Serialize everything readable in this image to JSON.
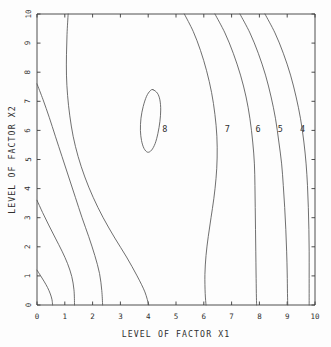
{
  "chart_data": {
    "type": "line",
    "title": "",
    "subtitle": "",
    "xlabel": "LEVEL OF FACTOR X1",
    "ylabel": "LEVEL OF FACTOR X2",
    "xlim": [
      0,
      10
    ],
    "ylim": [
      0,
      10
    ],
    "xticks": [
      "0",
      "1",
      "2",
      "3",
      "4",
      "5",
      "6",
      "7",
      "8",
      "9",
      "10"
    ],
    "yticks": [
      "0",
      "1",
      "2",
      "3",
      "4",
      "5",
      "6",
      "7",
      "8",
      "9",
      "10"
    ],
    "grid": false,
    "legend": "none",
    "plot_kind": "contour",
    "contour_levels": [
      8,
      7,
      6,
      5,
      4
    ],
    "annotations": [
      {
        "label": "8",
        "x": 4.6,
        "y": 6.05
      },
      {
        "label": "7",
        "x": 6.85,
        "y": 6.05
      },
      {
        "label": "6",
        "x": 7.95,
        "y": 6.05
      },
      {
        "label": "5",
        "x": 8.75,
        "y": 6.05
      },
      {
        "label": "4",
        "x": 9.55,
        "y": 6.05
      }
    ],
    "series": [
      {
        "name": "contour-8",
        "level": 8,
        "closed": true,
        "points": [
          [
            4.17,
            7.4
          ],
          [
            4.33,
            7.28
          ],
          [
            4.42,
            7.05
          ],
          [
            4.45,
            6.7
          ],
          [
            4.42,
            6.3
          ],
          [
            4.35,
            5.9
          ],
          [
            4.25,
            5.55
          ],
          [
            4.12,
            5.32
          ],
          [
            3.98,
            5.25
          ],
          [
            3.85,
            5.38
          ],
          [
            3.76,
            5.65
          ],
          [
            3.72,
            6.0
          ],
          [
            3.74,
            6.42
          ],
          [
            3.82,
            6.82
          ],
          [
            3.94,
            7.17
          ],
          [
            4.07,
            7.36
          ],
          [
            4.17,
            7.4
          ]
        ]
      },
      {
        "name": "contour-7",
        "level": 7,
        "closed": false,
        "points": [
          [
            5.3,
            10.0
          ],
          [
            5.62,
            9.4
          ],
          [
            5.88,
            8.75
          ],
          [
            6.1,
            8.05
          ],
          [
            6.28,
            7.3
          ],
          [
            6.4,
            6.55
          ],
          [
            6.47,
            5.8
          ],
          [
            6.48,
            5.05
          ],
          [
            6.44,
            4.35
          ],
          [
            6.36,
            3.65
          ],
          [
            6.26,
            3.0
          ],
          [
            6.16,
            2.35
          ],
          [
            6.08,
            1.7
          ],
          [
            6.04,
            1.05
          ],
          [
            6.05,
            0.4
          ],
          [
            6.08,
            0.0
          ]
        ]
      },
      {
        "name": "contour-6",
        "level": 6,
        "closed": false,
        "points": [
          [
            6.4,
            10.0
          ],
          [
            6.76,
            9.35
          ],
          [
            7.06,
            8.65
          ],
          [
            7.32,
            7.9
          ],
          [
            7.52,
            7.15
          ],
          [
            7.66,
            6.4
          ],
          [
            7.76,
            5.6
          ],
          [
            7.82,
            4.85
          ],
          [
            7.84,
            4.1
          ],
          [
            7.85,
            3.35
          ],
          [
            7.86,
            2.6
          ],
          [
            7.87,
            1.85
          ],
          [
            7.88,
            1.1
          ],
          [
            7.89,
            0.4
          ],
          [
            7.9,
            0.0
          ]
        ]
      },
      {
        "name": "contour-5",
        "level": 5,
        "closed": false,
        "points": [
          [
            7.3,
            10.0
          ],
          [
            7.66,
            9.35
          ],
          [
            7.96,
            8.65
          ],
          [
            8.22,
            7.9
          ],
          [
            8.42,
            7.15
          ],
          [
            8.58,
            6.4
          ],
          [
            8.7,
            5.6
          ],
          [
            8.8,
            4.85
          ],
          [
            8.86,
            4.1
          ],
          [
            8.91,
            3.35
          ],
          [
            8.95,
            2.6
          ],
          [
            8.98,
            1.85
          ],
          [
            9.0,
            1.1
          ],
          [
            9.01,
            0.4
          ],
          [
            9.02,
            0.0
          ]
        ]
      },
      {
        "name": "contour-4",
        "level": 4,
        "closed": false,
        "points": [
          [
            8.2,
            10.0
          ],
          [
            8.56,
            9.35
          ],
          [
            8.86,
            8.65
          ],
          [
            9.12,
            7.9
          ],
          [
            9.32,
            7.15
          ],
          [
            9.48,
            6.4
          ],
          [
            9.6,
            5.6
          ],
          [
            9.68,
            4.85
          ],
          [
            9.73,
            4.1
          ],
          [
            9.76,
            3.35
          ],
          [
            9.78,
            2.6
          ],
          [
            9.79,
            1.85
          ],
          [
            9.79,
            1.1
          ],
          [
            9.79,
            0.4
          ],
          [
            9.79,
            0.0
          ]
        ]
      },
      {
        "name": "contour-left-a",
        "level": 8,
        "closed": false,
        "points": [
          [
            1.12,
            10.0
          ],
          [
            1.08,
            9.3
          ],
          [
            1.06,
            8.6
          ],
          [
            1.06,
            7.9
          ],
          [
            1.1,
            7.2
          ],
          [
            1.18,
            6.5
          ],
          [
            1.3,
            5.8
          ],
          [
            1.48,
            5.1
          ],
          [
            1.72,
            4.4
          ],
          [
            2.02,
            3.7
          ],
          [
            2.38,
            3.0
          ],
          [
            2.8,
            2.3
          ],
          [
            3.22,
            1.65
          ],
          [
            3.6,
            1.0
          ],
          [
            3.88,
            0.45
          ],
          [
            4.02,
            0.0
          ]
        ]
      },
      {
        "name": "contour-left-b",
        "level": 7,
        "closed": false,
        "points": [
          [
            0.0,
            7.6
          ],
          [
            0.22,
            7.05
          ],
          [
            0.44,
            6.45
          ],
          [
            0.66,
            5.8
          ],
          [
            0.9,
            5.1
          ],
          [
            1.14,
            4.4
          ],
          [
            1.38,
            3.7
          ],
          [
            1.62,
            3.0
          ],
          [
            1.86,
            2.35
          ],
          [
            2.08,
            1.7
          ],
          [
            2.25,
            1.08
          ],
          [
            2.33,
            0.5
          ],
          [
            2.36,
            0.0
          ]
        ]
      },
      {
        "name": "contour-left-c",
        "level": 6,
        "closed": false,
        "points": [
          [
            0.0,
            3.6
          ],
          [
            0.2,
            3.18
          ],
          [
            0.42,
            2.75
          ],
          [
            0.66,
            2.3
          ],
          [
            0.9,
            1.85
          ],
          [
            1.1,
            1.42
          ],
          [
            1.25,
            0.98
          ],
          [
            1.33,
            0.52
          ],
          [
            1.35,
            0.0
          ]
        ]
      },
      {
        "name": "contour-left-d",
        "level": 5,
        "closed": false,
        "points": [
          [
            0.0,
            1.2
          ],
          [
            0.12,
            1.02
          ],
          [
            0.25,
            0.82
          ],
          [
            0.38,
            0.6
          ],
          [
            0.48,
            0.38
          ],
          [
            0.54,
            0.18
          ],
          [
            0.56,
            0.0
          ]
        ]
      }
    ]
  }
}
